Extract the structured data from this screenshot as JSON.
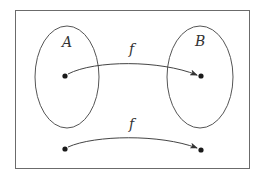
{
  "diagram": {
    "title": "",
    "frame": {
      "x": 15,
      "y": 10,
      "width": 234,
      "height": 158,
      "stroke": "#6b6b6b"
    },
    "sets": [
      {
        "label": "A",
        "cx": 67,
        "cy": 77,
        "rx": 32,
        "ry": 51,
        "label_x": 63,
        "label_y": 46
      },
      {
        "label": "B",
        "cx": 200,
        "cy": 77,
        "rx": 33,
        "ry": 51,
        "label_x": 197,
        "label_y": 45
      }
    ],
    "points": [
      {
        "name": "a-point",
        "x": 65,
        "y": 76
      },
      {
        "name": "b-point",
        "x": 201,
        "y": 76
      },
      {
        "name": "bottom-left-point",
        "x": 65,
        "y": 149
      },
      {
        "name": "bottom-right-point",
        "x": 201,
        "y": 150
      }
    ],
    "arrows": [
      {
        "label": "f",
        "from": "a-point",
        "to": "b-point",
        "label_x": 132,
        "label_y": 52
      },
      {
        "label": "f",
        "from": "bottom-left-point",
        "to": "bottom-right-point",
        "label_x": 132,
        "label_y": 127
      }
    ],
    "colors": {
      "line": "#555555",
      "dot": "#1a1a1a",
      "text": "#333333"
    }
  }
}
